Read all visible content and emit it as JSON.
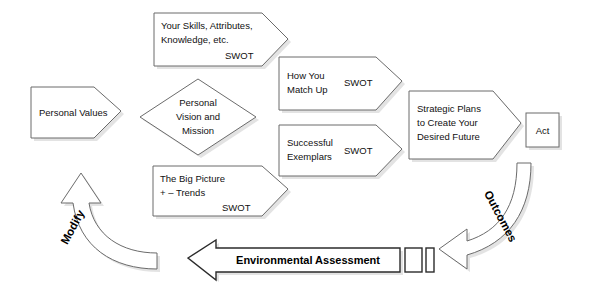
{
  "diagram": {
    "background": "#ffffff",
    "stroke_color": "#6b6b6b",
    "text_color": "#111111",
    "nodes": {
      "skills": {
        "line1": "Your Skills, Attributes,",
        "line2": "Knowledge, etc.",
        "tag": "SWOT"
      },
      "personal_values": {
        "label": "Personal Values"
      },
      "vision": {
        "line1": "Personal",
        "line2": "Vision and",
        "line3": "Mission"
      },
      "big_picture": {
        "line1": "The Big Picture",
        "line2": "+ – Trends",
        "tag": "SWOT"
      },
      "match_up": {
        "line1": "How You",
        "line2": "Match Up",
        "tag": "SWOT"
      },
      "exemplars": {
        "line1": "Successful",
        "line2": "Exemplars",
        "tag": "SWOT"
      },
      "strategic_plans": {
        "line1": "Strategic Plans",
        "line2": "to Create Your",
        "line3": "Desired Future"
      },
      "act": {
        "label": "Act"
      }
    },
    "connectors": {
      "environmental_assessment": {
        "label": "Environmental Assessment",
        "direction": "left"
      },
      "outcomes": {
        "label": "Outcomes",
        "direction": "curve-down-left"
      },
      "modify": {
        "label": "Modify",
        "direction": "curve-up-right"
      }
    }
  }
}
